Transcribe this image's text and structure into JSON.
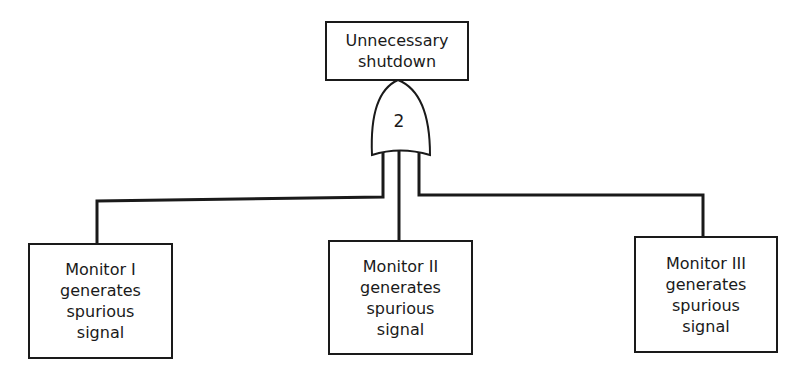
{
  "diagram": {
    "type": "fault-tree",
    "top_event": {
      "lines": [
        "Unnecessary",
        "shutdown"
      ]
    },
    "gate": {
      "type": "voting-or-gate",
      "label": "2"
    },
    "basic_events": [
      {
        "lines": [
          "Monitor I",
          "generates",
          "spurious",
          "signal"
        ]
      },
      {
        "lines": [
          "Monitor II",
          "generates",
          "spurious",
          "signal"
        ]
      },
      {
        "lines": [
          "Monitor III",
          "generates",
          "spurious",
          "signal"
        ]
      }
    ],
    "colors": {
      "line": "#1a1a1a",
      "background": "#ffffff"
    }
  }
}
